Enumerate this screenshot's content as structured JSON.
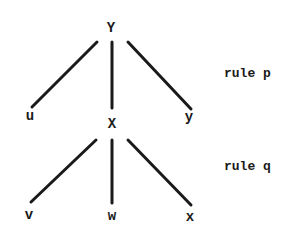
{
  "diagram": {
    "type": "tree",
    "nodes": {
      "root": {
        "label": "Y",
        "x": 111,
        "y": 28
      },
      "u": {
        "label": "u",
        "x": 30,
        "y": 116
      },
      "X": {
        "label": "X",
        "x": 112,
        "y": 124
      },
      "y": {
        "label": "y",
        "x": 189,
        "y": 117
      },
      "v": {
        "label": "v",
        "x": 29,
        "y": 215
      },
      "w": {
        "label": "w",
        "x": 112,
        "y": 216
      },
      "x": {
        "label": "x",
        "x": 190,
        "y": 217
      }
    },
    "edges": [
      {
        "from": "Y",
        "to": "u"
      },
      {
        "from": "Y",
        "to": "X"
      },
      {
        "from": "Y",
        "to": "y"
      },
      {
        "from": "X",
        "to": "v"
      },
      {
        "from": "X",
        "to": "w"
      },
      {
        "from": "X",
        "to": "x"
      }
    ],
    "rules": [
      {
        "label": "rule p"
      },
      {
        "label": "rule q"
      }
    ],
    "line_color": "#1a1a1a"
  }
}
